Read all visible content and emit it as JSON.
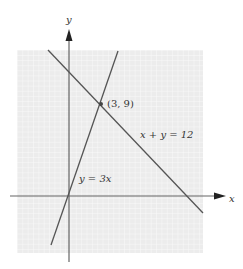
{
  "diagram": {
    "type": "linear-system-graph",
    "axes": {
      "x_label": "x",
      "y_label": "y"
    },
    "lines": [
      {
        "equation": "y = 3x",
        "label": "y = 3x"
      },
      {
        "equation": "x + y = 12",
        "label": "x + y = 12"
      }
    ],
    "intersection": {
      "point": [
        3,
        9
      ],
      "label": "(3, 9)"
    },
    "colors": {
      "grid_bg": "#eeeeee",
      "grid_line": "#ffffff",
      "line": "#555555",
      "axis": "#666666"
    }
  }
}
